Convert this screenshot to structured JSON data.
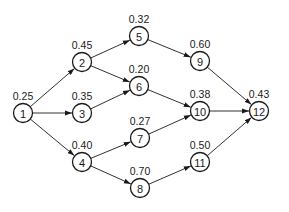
{
  "diagram": {
    "type": "directed-network",
    "node_radius": 9.5,
    "colors": {
      "stroke": "#1a1a1a",
      "fill": "#ffffff",
      "background": "#ffffff"
    },
    "nodes": [
      {
        "id": "1",
        "label": "1",
        "value": "0.25",
        "x": 23,
        "y": 113
      },
      {
        "id": "2",
        "label": "2",
        "value": "0.45",
        "x": 82,
        "y": 62
      },
      {
        "id": "3",
        "label": "3",
        "value": "0.35",
        "x": 82,
        "y": 113
      },
      {
        "id": "4",
        "label": "4",
        "value": "0.40",
        "x": 82,
        "y": 162
      },
      {
        "id": "5",
        "label": "5",
        "value": "0.32",
        "x": 139,
        "y": 36
      },
      {
        "id": "6",
        "label": "6",
        "value": "0.20",
        "x": 139,
        "y": 86
      },
      {
        "id": "7",
        "label": "7",
        "value": "0.27",
        "x": 140,
        "y": 138
      },
      {
        "id": "8",
        "label": "8",
        "value": "0.70",
        "x": 140,
        "y": 188
      },
      {
        "id": "9",
        "label": "9",
        "value": "0.60",
        "x": 200,
        "y": 61
      },
      {
        "id": "10",
        "label": "10",
        "value": "0.38",
        "x": 200,
        "y": 111
      },
      {
        "id": "11",
        "label": "11",
        "value": "0.50",
        "x": 200,
        "y": 162
      },
      {
        "id": "12",
        "label": "12",
        "value": "0.43",
        "x": 259,
        "y": 111
      }
    ],
    "edges": [
      {
        "from": "1",
        "to": "2"
      },
      {
        "from": "1",
        "to": "3"
      },
      {
        "from": "1",
        "to": "4"
      },
      {
        "from": "2",
        "to": "5"
      },
      {
        "from": "2",
        "to": "6"
      },
      {
        "from": "3",
        "to": "6"
      },
      {
        "from": "4",
        "to": "7"
      },
      {
        "from": "4",
        "to": "8"
      },
      {
        "from": "5",
        "to": "9"
      },
      {
        "from": "6",
        "to": "10"
      },
      {
        "from": "7",
        "to": "10"
      },
      {
        "from": "8",
        "to": "11"
      },
      {
        "from": "9",
        "to": "12"
      },
      {
        "from": "10",
        "to": "12"
      },
      {
        "from": "11",
        "to": "12"
      }
    ]
  }
}
